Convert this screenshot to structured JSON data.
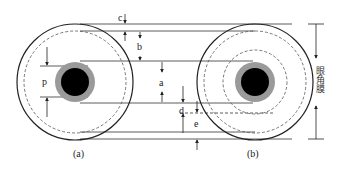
{
  "figure": {
    "panels": [
      {
        "id": "a",
        "caption": "(a)"
      },
      {
        "id": "b",
        "caption": "(b)"
      }
    ],
    "dimension_labels": {
      "c_top": "c",
      "b": "b",
      "a": "a",
      "p": "p",
      "d": "d",
      "e": "e"
    },
    "side_label": "眼角膜",
    "colors": {
      "line": "#222222",
      "pupil": "#000000",
      "iris_ring": "#9a9a9a",
      "dashed": "#555555",
      "background": "#ffffff"
    }
  }
}
